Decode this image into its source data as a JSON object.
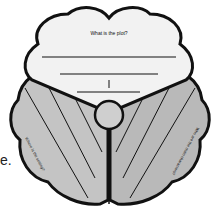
{
  "organizer": {
    "top_prompt": "What is the plot?",
    "left_prompt": "Where is the setting?",
    "right_prompt": "Who are the main characters?",
    "edge_fragment": "e."
  },
  "colors": {
    "outline": "#111111",
    "top_fill": "#f2f2f2",
    "left_fill": "#c4c4c4",
    "right_fill": "#b9b9b9",
    "circle_fill": "#cfcfcf"
  }
}
